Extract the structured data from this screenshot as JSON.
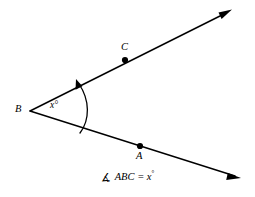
{
  "figure": {
    "background_color": "#ffffff",
    "stroke_color": "#000000",
    "points": {
      "B": {
        "label": "B",
        "x": 30,
        "y": 111,
        "marked": false
      },
      "C": {
        "label": "C",
        "x": 125,
        "y": 60,
        "marked": true
      },
      "A": {
        "label": "A",
        "x": 140,
        "y": 146,
        "marked": true
      }
    },
    "rays": [
      {
        "name": "ray-BC",
        "from": "B",
        "through": "C",
        "tip_x": 230,
        "tip_y": 11,
        "arrow": "end"
      },
      {
        "name": "ray-BA",
        "from": "B",
        "through": "A",
        "tip_x": 240,
        "tip_y": 178,
        "arrow": "end"
      }
    ],
    "angle_arc": {
      "name": "angle-arc",
      "vertex": "B",
      "from_ray": "ray-BA",
      "to_ray": "ray-BC",
      "arrow": "end",
      "direction": "counterclockwise"
    },
    "angle_label": "x°",
    "angle_label_value": "x",
    "degree_symbol": "°"
  },
  "caption": {
    "angle_symbol": "∡",
    "text": "ABC = x",
    "degree": "°",
    "full_text": "∡ ABC = x°"
  }
}
